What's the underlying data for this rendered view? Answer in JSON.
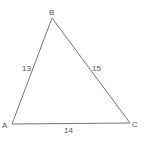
{
  "diagram": {
    "type": "triangle",
    "vertices": {
      "A": {
        "label": "A",
        "x": 12,
        "y": 124
      },
      "B": {
        "label": "B",
        "x": 52,
        "y": 18
      },
      "C": {
        "label": "C",
        "x": 130,
        "y": 123
      }
    },
    "sides": {
      "AB": {
        "label": "13"
      },
      "BC": {
        "label": "15"
      },
      "AC": {
        "label": "14"
      }
    },
    "stroke_color": "#666666"
  }
}
